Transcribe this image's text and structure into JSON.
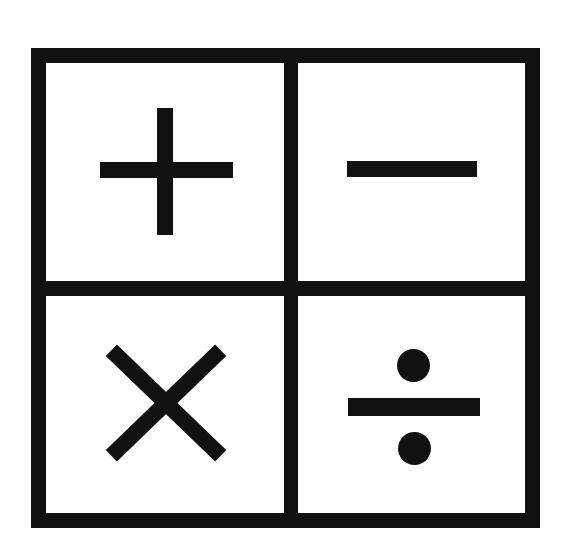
{
  "canvas": {
    "width": 578,
    "height": 558,
    "background_color": "#ffffff",
    "ink_color": "#111111",
    "title": "Arithmetic Operator Grid"
  },
  "grid": {
    "rows": 2,
    "columns": 2,
    "border_color": "#111111",
    "border_thickness_px": 15,
    "cells": [
      {
        "position": "top-left",
        "icon_name": "plus-icon",
        "symbol": "+",
        "operation": "addition"
      },
      {
        "position": "top-right",
        "icon_name": "minus-icon",
        "symbol": "−",
        "operation": "subtraction"
      },
      {
        "position": "bottom-left",
        "icon_name": "multiply-icon",
        "symbol": "×",
        "operation": "multiplication"
      },
      {
        "position": "bottom-right",
        "icon_name": "divide-icon",
        "symbol": "÷",
        "operation": "division"
      }
    ]
  }
}
